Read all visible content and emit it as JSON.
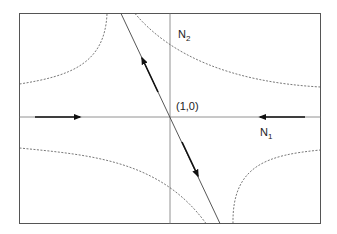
{
  "diagram": {
    "type": "phase-portrait",
    "labels": {
      "n2": {
        "base": "N",
        "sub": "2"
      },
      "n1": {
        "base": "N",
        "sub": "1"
      },
      "fixed_point": "(1,0)"
    },
    "elements": {
      "frame": "rectangular border",
      "horizontal_axis": "N1 axis through fixed point with arrows pointing toward (1,0)",
      "vertical_axis": "N2 axis through fixed point",
      "stable_manifold": "horizontal line with inward arrows",
      "unstable_manifold": "steep line through (1,0) with outward arrows",
      "trajectories": "four dashed hyperbola-like curves in each quadrant"
    },
    "colors": {
      "line": "#333333",
      "frame": "#555555",
      "dashed": "#555555"
    }
  }
}
